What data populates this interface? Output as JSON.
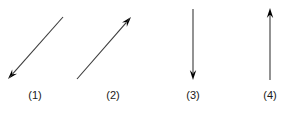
{
  "figure": {
    "title": "",
    "background_color": "#ffffff",
    "stroke_color": "#3a3a3a",
    "arrowhead_color": "#000000",
    "label_color": "#1a1a1a",
    "width": 290,
    "height": 114,
    "arrows": [
      {
        "id": "arrow-1",
        "label": "(1)",
        "direction": "down-left",
        "orientation": "diagonal",
        "tail_x": 63,
        "tail_y": 17,
        "tip_x": 8,
        "tip_y": 79,
        "label_x": 35,
        "label_y": 90
      },
      {
        "id": "arrow-2",
        "label": "(2)",
        "direction": "up-right",
        "orientation": "diagonal",
        "tail_x": 77,
        "tail_y": 79,
        "tip_x": 131,
        "tip_y": 17,
        "label_x": 113,
        "label_y": 90
      },
      {
        "id": "arrow-3",
        "label": "(3)",
        "direction": "down",
        "orientation": "vertical",
        "tail_x": 193,
        "tail_y": 9,
        "tip_x": 193,
        "tip_y": 80,
        "label_x": 193,
        "label_y": 90
      },
      {
        "id": "arrow-4",
        "label": "(4)",
        "direction": "up",
        "orientation": "vertical",
        "tail_x": 270,
        "tail_y": 80,
        "tip_x": 270,
        "tip_y": 8,
        "label_x": 270,
        "label_y": 90
      }
    ]
  }
}
